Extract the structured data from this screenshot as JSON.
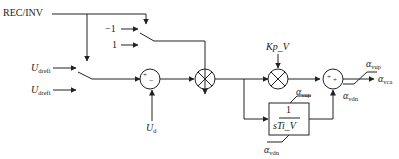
{
  "diagram": {
    "colors": {
      "line": "#222222",
      "background": "#ffffff"
    },
    "inputs": {
      "mode": "REC/INV",
      "sign_neg": "−1",
      "sign_pos": "1",
      "ref1_main": "U",
      "ref1_sub": "drefi",
      "ref2_main": "U",
      "ref2_sub": "drefi",
      "meas_main": "U",
      "meas_sub": "d"
    },
    "blocks": {
      "sum1_plus": "+",
      "sum1_minus": "−",
      "mult1": "×",
      "mult2": "×",
      "kp_label": "Kp_V",
      "integrator_num": "1",
      "integrator_den": "sTi_V",
      "sum2_plus1": "+",
      "sum2_plus2": "+"
    },
    "limits": {
      "int_upper_main": "α",
      "int_upper_sub": "vup",
      "int_lower_main": "α",
      "int_lower_sub": "vdn",
      "out_upper_main": "α",
      "out_upper_sub": "vup",
      "out_lower_main": "α",
      "out_lower_sub": "vdn"
    },
    "output": {
      "main": "α",
      "sub": "vca"
    }
  }
}
